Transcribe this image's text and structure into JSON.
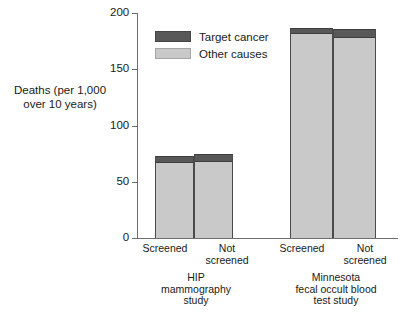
{
  "chart_data": {
    "type": "bar",
    "subtype": "stacked-bar",
    "title": "",
    "xlabel": "",
    "ylabel": "Deaths (per 1,000 over 10 years)",
    "ylim": [
      0,
      200
    ],
    "yticks": [
      0,
      50,
      100,
      150,
      200
    ],
    "ytick_labels": [
      "0",
      "50",
      "100",
      "150",
      "200"
    ],
    "grid": false,
    "legend_position": "upper-left-inside",
    "categories": [
      "Screened",
      "Not screened",
      "Screened",
      "Not screened"
    ],
    "groups": [
      {
        "name": "HIP mammography study",
        "bars": [
          {
            "category": "Screened",
            "target_cancer": 6,
            "other_causes": 67,
            "total": 73
          },
          {
            "category": "Not screened",
            "target_cancer": 7,
            "other_causes": 68,
            "total": 75
          }
        ]
      },
      {
        "name": "Minnesota fecal occult blood test study",
        "bars": [
          {
            "category": "Screened",
            "target_cancer": 6,
            "other_causes": 181,
            "total": 187
          },
          {
            "category": "Not screened",
            "target_cancer": 8,
            "other_causes": 178,
            "total": 186
          }
        ]
      }
    ],
    "series": [
      {
        "name": "Target cancer",
        "color": "#585858",
        "values": [
          6,
          7,
          6,
          8
        ]
      },
      {
        "name": "Other causes",
        "color": "#c9c9c9",
        "values": [
          67,
          68,
          181,
          178
        ]
      }
    ]
  },
  "axis": {
    "y_title_line1": "Deaths (per 1,000",
    "y_title_line2": "over 10 years)",
    "y_title": "Deaths (per 1,000 over 10 years)",
    "ticks": [
      {
        "value": 200,
        "label": "200"
      },
      {
        "value": 150,
        "label": "150"
      },
      {
        "value": 100,
        "label": "100"
      },
      {
        "value": 50,
        "label": "50"
      },
      {
        "value": 0,
        "label": "0"
      }
    ]
  },
  "legend": {
    "items": [
      {
        "label": "Target cancer",
        "color": "#585858"
      },
      {
        "label": "Other causes",
        "color": "#c9c9c9"
      }
    ]
  },
  "x_labels": {
    "g1_screened": "Screened",
    "g1_not_screened": "Not\nscreened",
    "g2_screened": "Screened",
    "g2_not_screened": "Not\nscreened"
  },
  "group_captions": {
    "group1": "HIP\nmammography\nstudy",
    "group2": "Minnesota\nfecal occult blood\ntest study"
  },
  "colors": {
    "target_cancer": "#585858",
    "other_causes": "#c9c9c9",
    "axis": "#6e6e6e",
    "bar_outline": "#4a4a4a",
    "text": "#1a1a1a",
    "background": "#ffffff"
  }
}
